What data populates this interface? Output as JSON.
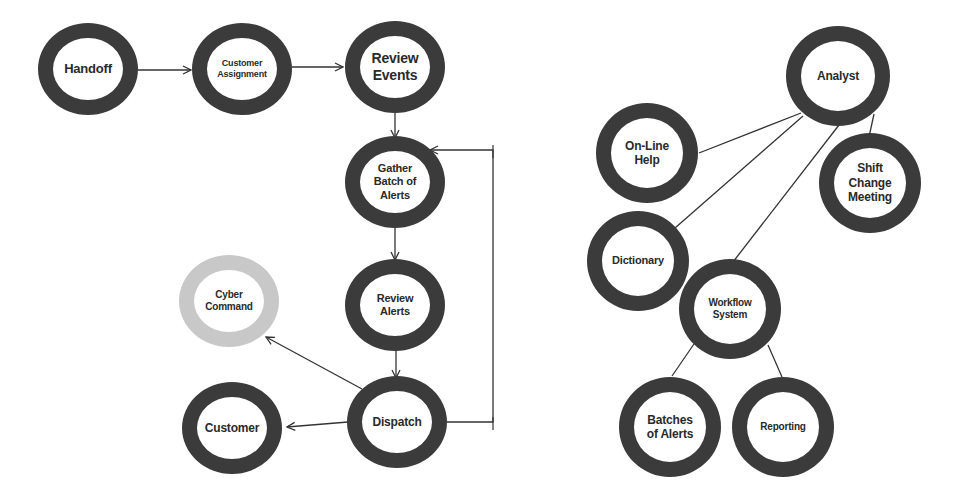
{
  "colors": {
    "ring": "#3b3b3b",
    "ring_light": "#c8c8c8",
    "edge": "#333333",
    "text": "#2a2a2a",
    "background": "#ffffff"
  },
  "left_diagram": {
    "name": "analyst-workflow",
    "nodes": [
      {
        "id": "handoff",
        "label": "Handoff",
        "cx": 88,
        "cy": 69,
        "rx": 50,
        "ry": 46,
        "font": 13,
        "ring": "dark"
      },
      {
        "id": "customer-assignment",
        "label": "Customer\nAssignment",
        "cx": 242,
        "cy": 69,
        "rx": 50,
        "ry": 46,
        "font": 9,
        "ring": "dark"
      },
      {
        "id": "review-events",
        "label": "Review\nEvents",
        "cx": 395,
        "cy": 67,
        "rx": 50,
        "ry": 46,
        "font": 14,
        "ring": "dark"
      },
      {
        "id": "gather-batch",
        "label": "Gather\nBatch of\nAlerts",
        "cx": 395,
        "cy": 182,
        "rx": 50,
        "ry": 46,
        "font": 11,
        "ring": "dark"
      },
      {
        "id": "review-alerts",
        "label": "Review\nAlerts",
        "cx": 395,
        "cy": 305,
        "rx": 50,
        "ry": 46,
        "font": 11,
        "ring": "dark"
      },
      {
        "id": "cyber-command",
        "label": "Cyber\nCommand",
        "cx": 229,
        "cy": 301,
        "rx": 50,
        "ry": 46,
        "font": 10,
        "ring": "light"
      },
      {
        "id": "dispatch",
        "label": "Dispatch",
        "cx": 397,
        "cy": 422,
        "rx": 50,
        "ry": 46,
        "font": 12,
        "ring": "dark"
      },
      {
        "id": "customer",
        "label": "Customer",
        "cx": 232,
        "cy": 428,
        "rx": 50,
        "ry": 46,
        "font": 12,
        "ring": "dark"
      }
    ],
    "edges": [
      {
        "from": "handoff",
        "to": "customer-assignment",
        "arrow": true,
        "points": [
          [
            138,
            70
          ],
          [
            191,
            70
          ]
        ]
      },
      {
        "from": "customer-assignment",
        "to": "review-events",
        "arrow": true,
        "points": [
          [
            292,
            67
          ],
          [
            343,
            67
          ]
        ]
      },
      {
        "from": "review-events",
        "to": "gather-batch",
        "arrow": true,
        "points": [
          [
            395,
            113
          ],
          [
            395,
            138
          ]
        ]
      },
      {
        "from": "gather-batch",
        "to": "review-alerts",
        "arrow": true,
        "points": [
          [
            395,
            228
          ],
          [
            395,
            260
          ]
        ]
      },
      {
        "from": "review-alerts",
        "to": "dispatch",
        "arrow": true,
        "points": [
          [
            396,
            350
          ],
          [
            396,
            378
          ]
        ]
      },
      {
        "from": "dispatch",
        "to": "cyber-command",
        "arrow": true,
        "points": [
          [
            362,
            389
          ],
          [
            266,
            337
          ]
        ]
      },
      {
        "from": "dispatch",
        "to": "customer",
        "arrow": true,
        "points": [
          [
            348,
            422
          ],
          [
            287,
            427
          ]
        ]
      },
      {
        "from": "dispatch",
        "to": "gather-batch",
        "arrow": true,
        "points": [
          [
            447,
            422
          ],
          [
            493,
            422
          ],
          [
            493,
            150
          ],
          [
            430,
            150
          ]
        ]
      }
    ]
  },
  "right_diagram": {
    "name": "analyst-resources",
    "nodes": [
      {
        "id": "analyst",
        "label": "Analyst",
        "cx": 838,
        "cy": 76,
        "rx": 52,
        "ry": 50,
        "font": 12,
        "ring": "dark"
      },
      {
        "id": "on-line-help",
        "label": "On-Line\nHelp",
        "cx": 647,
        "cy": 153,
        "rx": 51,
        "ry": 50,
        "font": 12,
        "ring": "dark"
      },
      {
        "id": "shift-change-meeting",
        "label": "Shift\nChange\nMeeting",
        "cx": 870,
        "cy": 183,
        "rx": 51,
        "ry": 50,
        "font": 12,
        "ring": "dark"
      },
      {
        "id": "dictionary",
        "label": "Dictionary",
        "cx": 638,
        "cy": 261,
        "rx": 51,
        "ry": 50,
        "font": 11,
        "ring": "dark"
      },
      {
        "id": "workflow-system",
        "label": "Workflow\nSystem",
        "cx": 730,
        "cy": 309,
        "rx": 51,
        "ry": 50,
        "font": 10,
        "ring": "dark"
      },
      {
        "id": "batches-of-alerts",
        "label": "Batches\nof Alerts",
        "cx": 670,
        "cy": 427,
        "rx": 51,
        "ry": 50,
        "font": 12,
        "ring": "dark"
      },
      {
        "id": "reporting",
        "label": "Reporting",
        "cx": 783,
        "cy": 427,
        "rx": 51,
        "ry": 50,
        "font": 10,
        "ring": "dark"
      }
    ],
    "edges": [
      {
        "from": "analyst",
        "to": "on-line-help",
        "arrow": false,
        "points": [
          [
            801,
            113
          ],
          [
            699,
            153
          ]
        ]
      },
      {
        "from": "analyst",
        "to": "dictionary",
        "arrow": false,
        "points": [
          [
            803,
            116
          ],
          [
            675,
            228
          ]
        ]
      },
      {
        "from": "analyst",
        "to": "workflow-system",
        "arrow": false,
        "points": [
          [
            839,
            125
          ],
          [
            733,
            262
          ]
        ]
      },
      {
        "from": "analyst",
        "to": "shift-change-meeting",
        "arrow": false,
        "points": [
          [
            874,
            114
          ],
          [
            869,
            137
          ]
        ]
      },
      {
        "from": "workflow-system",
        "to": "batches-of-alerts",
        "arrow": false,
        "points": [
          [
            694,
            344
          ],
          [
            672,
            376
          ]
        ]
      },
      {
        "from": "workflow-system",
        "to": "reporting",
        "arrow": false,
        "points": [
          [
            768,
            345
          ],
          [
            782,
            377
          ]
        ]
      }
    ]
  }
}
